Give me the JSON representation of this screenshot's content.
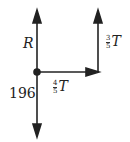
{
  "diagram": {
    "type": "free-body force diagram",
    "point": {
      "x": 37,
      "y": 72
    },
    "forces": [
      {
        "id": "R",
        "direction": "up",
        "label": "R"
      },
      {
        "id": "weight",
        "direction": "down",
        "label": "196"
      },
      {
        "id": "horizontal",
        "direction": "right",
        "label_num": "4",
        "label_den": "5",
        "label_var": "T"
      },
      {
        "id": "vertical_right",
        "direction": "up",
        "label_num": "3",
        "label_den": "5",
        "label_var": "T"
      }
    ],
    "color": "#222222"
  }
}
